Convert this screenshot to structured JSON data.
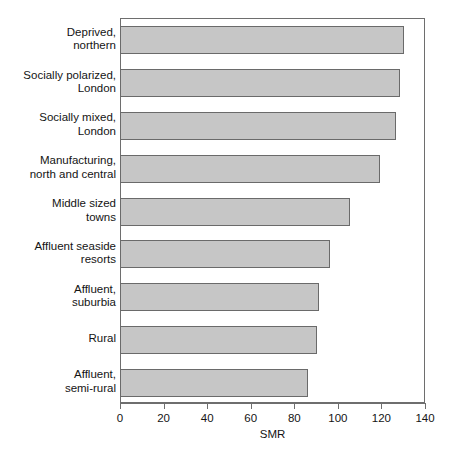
{
  "chart_data": {
    "type": "bar",
    "orientation": "horizontal",
    "title": "",
    "xlabel": "SMR",
    "ylabel": "",
    "xlim": [
      0,
      140
    ],
    "xticks": [
      0,
      20,
      40,
      60,
      80,
      100,
      120,
      140
    ],
    "xtick_labels": [
      "0",
      "20",
      "40",
      "60",
      "80",
      "100",
      "120",
      "140"
    ],
    "grid": false,
    "legend": null,
    "bar_color": "#c6c6c6",
    "bar_edge_color": "#6a6a6a",
    "categories": [
      "Deprived,\nnorthern",
      "Socially polarized,\nLondon",
      "Socially mixed,\nLondon",
      "Manufacturing,\nnorth and central",
      "Middle sized\ntowns",
      "Affluent seaside\nresorts",
      "Affluent,\nsuburbia",
      "Rural",
      "Affluent,\nsemi-rural"
    ],
    "values": [
      130,
      128,
      126,
      119,
      105,
      96,
      91,
      90,
      86
    ]
  }
}
